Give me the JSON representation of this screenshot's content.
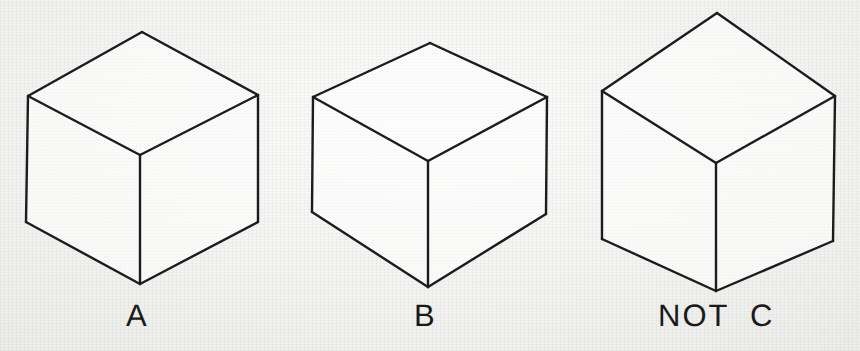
{
  "figure": {
    "background_color": "#f1f1ef",
    "ink_color": "#1c1c1c",
    "width": 860,
    "height": 351
  },
  "labels": {
    "a": "A",
    "b": "B",
    "c": "NOT  C"
  },
  "cubes": [
    {
      "id": "cube-a",
      "label": "A",
      "vertices": {
        "apex_top": [
          142,
          32
        ],
        "left_top": [
          28,
          96
        ],
        "right_top": [
          258,
          95
        ],
        "center": [
          140,
          155
        ],
        "left_bottom": [
          26,
          222
        ],
        "center_bottom": [
          140,
          284
        ],
        "right_bottom": [
          258,
          222
        ]
      }
    },
    {
      "id": "cube-b",
      "label": "B",
      "vertices": {
        "apex_top": [
          430,
          43
        ],
        "left_top": [
          313,
          97
        ],
        "right_top": [
          547,
          97
        ],
        "center": [
          428,
          161
        ],
        "left_bottom": [
          312,
          212
        ],
        "center_bottom": [
          428,
          287
        ],
        "right_bottom": [
          546,
          214
        ]
      }
    },
    {
      "id": "cube-c",
      "label": "NOT  C",
      "vertices": {
        "apex_top": [
          717,
          13
        ],
        "left_top": [
          602,
          91
        ],
        "right_top": [
          835,
          96
        ],
        "center": [
          716,
          163
        ],
        "left_bottom": [
          602,
          239
        ],
        "center_bottom": [
          716,
          291
        ],
        "right_bottom": [
          833,
          241
        ]
      }
    }
  ]
}
